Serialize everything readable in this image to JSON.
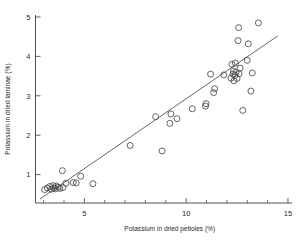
{
  "chart_data": {
    "type": "scatter",
    "title": "",
    "xlabel": "Potassium in dried petioles (%)",
    "ylabel": "Potassium in dried laminae (%)",
    "xlim": [
      2.6,
      15.2
    ],
    "ylim": [
      0.28,
      5.05
    ],
    "grid": false,
    "legend": null,
    "x_major_ticks": [
      5,
      10,
      15
    ],
    "x_major_tick_labels": [
      "5",
      "10",
      "15"
    ],
    "x_minor_ticks": [
      3,
      4,
      6,
      7,
      8,
      9,
      11,
      12,
      13,
      14
    ],
    "y_major_ticks": [
      1,
      2,
      3,
      4,
      5
    ],
    "y_major_tick_labels": [
      "1",
      "2",
      "3",
      "4",
      "5"
    ],
    "y_minor_ticks": [],
    "marker": "open-circle",
    "marker_size_px": 3,
    "points": [
      {
        "x": 3.05,
        "y": 0.62
      },
      {
        "x": 3.18,
        "y": 0.66
      },
      {
        "x": 3.3,
        "y": 0.7
      },
      {
        "x": 3.38,
        "y": 0.63
      },
      {
        "x": 3.45,
        "y": 0.72
      },
      {
        "x": 3.5,
        "y": 0.66
      },
      {
        "x": 3.58,
        "y": 0.64
      },
      {
        "x": 3.62,
        "y": 0.71
      },
      {
        "x": 3.72,
        "y": 0.68
      },
      {
        "x": 3.8,
        "y": 0.65
      },
      {
        "x": 3.92,
        "y": 1.1
      },
      {
        "x": 3.95,
        "y": 0.67
      },
      {
        "x": 4.1,
        "y": 0.78
      },
      {
        "x": 4.45,
        "y": 0.8
      },
      {
        "x": 4.6,
        "y": 0.79
      },
      {
        "x": 4.82,
        "y": 0.96
      },
      {
        "x": 5.42,
        "y": 0.77
      },
      {
        "x": 7.25,
        "y": 1.74
      },
      {
        "x": 8.5,
        "y": 2.47
      },
      {
        "x": 8.82,
        "y": 1.6
      },
      {
        "x": 9.2,
        "y": 2.3
      },
      {
        "x": 9.25,
        "y": 2.54
      },
      {
        "x": 9.55,
        "y": 2.42
      },
      {
        "x": 10.3,
        "y": 2.67
      },
      {
        "x": 10.95,
        "y": 2.74
      },
      {
        "x": 10.98,
        "y": 2.8
      },
      {
        "x": 11.2,
        "y": 3.55
      },
      {
        "x": 11.35,
        "y": 3.08
      },
      {
        "x": 11.4,
        "y": 3.18
      },
      {
        "x": 11.85,
        "y": 3.53
      },
      {
        "x": 12.2,
        "y": 3.45
      },
      {
        "x": 12.25,
        "y": 3.8
      },
      {
        "x": 12.3,
        "y": 3.55
      },
      {
        "x": 12.32,
        "y": 3.62
      },
      {
        "x": 12.35,
        "y": 3.38
      },
      {
        "x": 12.4,
        "y": 3.52
      },
      {
        "x": 12.42,
        "y": 3.83
      },
      {
        "x": 12.45,
        "y": 3.6
      },
      {
        "x": 12.5,
        "y": 3.44
      },
      {
        "x": 12.55,
        "y": 4.4
      },
      {
        "x": 12.58,
        "y": 4.73
      },
      {
        "x": 12.6,
        "y": 3.56
      },
      {
        "x": 12.65,
        "y": 3.7
      },
      {
        "x": 12.78,
        "y": 2.63
      },
      {
        "x": 13.0,
        "y": 3.9
      },
      {
        "x": 13.05,
        "y": 4.32
      },
      {
        "x": 13.18,
        "y": 3.12
      },
      {
        "x": 13.25,
        "y": 3.58
      },
      {
        "x": 13.55,
        "y": 4.85
      }
    ],
    "fit_line": {
      "x_start": 2.82,
      "y_start": 0.38,
      "x_end": 14.5,
      "y_end": 4.52
    }
  }
}
